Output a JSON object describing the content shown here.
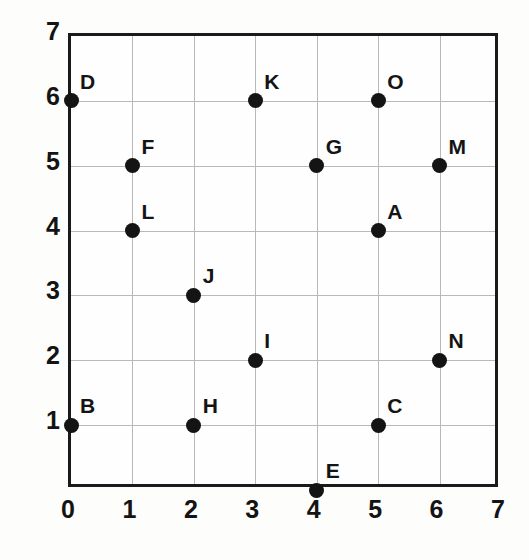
{
  "chart_data": {
    "type": "scatter",
    "title": "",
    "xlabel": "",
    "ylabel": "",
    "xlim": [
      0,
      7
    ],
    "ylim": [
      0,
      7
    ],
    "xticks": [
      "0",
      "1",
      "2",
      "3",
      "4",
      "5",
      "6",
      "7"
    ],
    "yticks": [
      "0",
      "1",
      "2",
      "3",
      "4",
      "5",
      "6",
      "7"
    ],
    "grid": true,
    "legend": "none",
    "point_color": "#141414",
    "grid_color": "#b9b9b9",
    "frame_color": "#1a1a1a",
    "points": [
      {
        "label": "A",
        "x": 5,
        "y": 4
      },
      {
        "label": "B",
        "x": 0,
        "y": 1
      },
      {
        "label": "C",
        "x": 5,
        "y": 1
      },
      {
        "label": "D",
        "x": 0,
        "y": 6
      },
      {
        "label": "E",
        "x": 4,
        "y": 0
      },
      {
        "label": "F",
        "x": 1,
        "y": 5
      },
      {
        "label": "G",
        "x": 4,
        "y": 5
      },
      {
        "label": "H",
        "x": 2,
        "y": 1
      },
      {
        "label": "I",
        "x": 3,
        "y": 2
      },
      {
        "label": "J",
        "x": 2,
        "y": 3
      },
      {
        "label": "K",
        "x": 3,
        "y": 6
      },
      {
        "label": "L",
        "x": 1,
        "y": 4
      },
      {
        "label": "M",
        "x": 6,
        "y": 5
      },
      {
        "label": "N",
        "x": 6,
        "y": 2
      },
      {
        "label": "O",
        "x": 5,
        "y": 6
      }
    ]
  }
}
